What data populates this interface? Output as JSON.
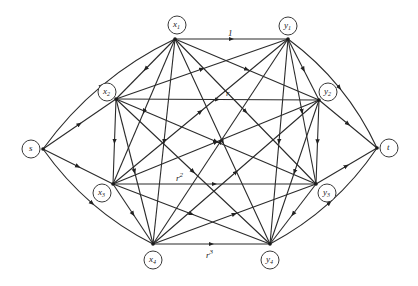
{
  "diagram": {
    "type": "directed-network",
    "nodes": [
      {
        "id": "s",
        "label": "s",
        "sub": "",
        "cx": 31,
        "cy": 149,
        "vx": 43,
        "vy": 149
      },
      {
        "id": "x1",
        "label": "x",
        "sub": "1",
        "cx": 177,
        "cy": 25,
        "vx": 175,
        "vy": 39
      },
      {
        "id": "x2",
        "label": "x",
        "sub": "2",
        "cx": 107,
        "cy": 92,
        "vx": 116,
        "vy": 99
      },
      {
        "id": "x3",
        "label": "x",
        "sub": "3",
        "cx": 102,
        "cy": 193,
        "vx": 113,
        "vy": 184
      },
      {
        "id": "x4",
        "label": "x",
        "sub": "4",
        "cx": 153,
        "cy": 260,
        "vx": 153,
        "vy": 244
      },
      {
        "id": "y1",
        "label": "y",
        "sub": "1",
        "cx": 288,
        "cy": 26,
        "vx": 288,
        "vy": 39
      },
      {
        "id": "y2",
        "label": "y",
        "sub": "2",
        "cx": 328,
        "cy": 92,
        "vx": 319,
        "vy": 100
      },
      {
        "id": "y3",
        "label": "y",
        "sub": "3",
        "cx": 327,
        "cy": 193,
        "vx": 316,
        "vy": 184
      },
      {
        "id": "y4",
        "label": "y",
        "sub": "4",
        "cx": 270,
        "cy": 260,
        "vx": 270,
        "vy": 244
      },
      {
        "id": "t",
        "label": "t",
        "sub": "",
        "cx": 389,
        "cy": 148,
        "vx": 377,
        "vy": 148
      }
    ],
    "edge_labels": [
      {
        "text": "1",
        "sup": "",
        "x": 228,
        "y": 36
      },
      {
        "text": "r",
        "sup": "",
        "x": 226,
        "y": 96
      },
      {
        "text": "r",
        "sup": "2",
        "x": 176,
        "y": 181
      },
      {
        "text": "r",
        "sup": "3",
        "x": 206,
        "y": 258
      }
    ],
    "source_edges": [
      "x1",
      "x2",
      "x3",
      "x4"
    ],
    "sink_edges": [
      "y1",
      "y2",
      "y3",
      "y4"
    ],
    "horizontal_edges": [
      [
        "x1",
        "y1"
      ],
      [
        "x2",
        "y2"
      ],
      [
        "x3",
        "y3"
      ],
      [
        "x4",
        "y4"
      ]
    ],
    "complete_edges_note": "every x_i connected to every y_j and vertical pairs x_i-x_j, y_i-y_j"
  }
}
